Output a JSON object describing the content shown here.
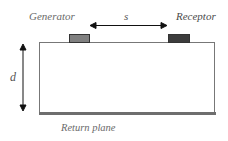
{
  "diagram": {
    "type": "microstrip-crosstalk-cross-section",
    "labels": {
      "generator": "Generator",
      "receptor": "Receptor",
      "spacing": "s",
      "height": "d",
      "return_plane": "Return plane"
    },
    "colors": {
      "generator_pad": "#808080",
      "receptor_pad": "#3c3c3c",
      "return_plane": "#6e6e6e",
      "substrate_fill": "#ffffff",
      "outline": "#777777",
      "arrow": "#111111"
    },
    "elements": [
      {
        "name": "substrate",
        "shape": "rectangle"
      },
      {
        "name": "generator-pad",
        "shape": "rectangle",
        "position": "top-left"
      },
      {
        "name": "receptor-pad",
        "shape": "rectangle",
        "position": "top-right"
      },
      {
        "name": "return-plane",
        "shape": "strip",
        "position": "bottom"
      },
      {
        "name": "spacing-arrow",
        "shape": "double-arrow",
        "orientation": "horizontal",
        "between": [
          "generator-pad",
          "receptor-pad"
        ]
      },
      {
        "name": "height-arrow",
        "shape": "double-arrow",
        "orientation": "vertical",
        "spans": "substrate"
      }
    ]
  }
}
